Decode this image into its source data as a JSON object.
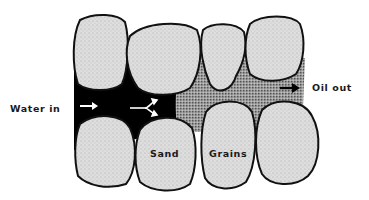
{
  "diagram": {
    "labels": {
      "water_in": "Water in",
      "oil_out": "Oil out",
      "sand": "Sand",
      "grains": "Grains"
    },
    "regions": {
      "water": {
        "name": "water",
        "color": "#000000"
      },
      "oil": {
        "name": "oil",
        "color": "#8a8a8a"
      },
      "grain": {
        "name": "sand grain",
        "color": "#d8d8d8",
        "outline": "#111111"
      }
    },
    "arrows": [
      {
        "name": "water-inflow-arrow",
        "color": "#ffffff"
      },
      {
        "name": "water-split-arrow",
        "color": "#ffffff"
      },
      {
        "name": "oil-outflow-arrow",
        "color": "#000000"
      }
    ]
  }
}
